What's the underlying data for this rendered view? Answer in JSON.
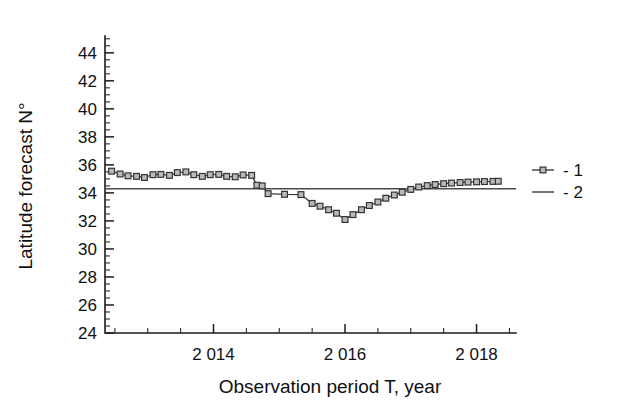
{
  "figure": {
    "background_color": "#ffffff",
    "width": 631,
    "height": 412
  },
  "chart_data": {
    "type": "line",
    "title": "",
    "subtitle": "",
    "xlabel": "Observation period T, year",
    "ylabel": "Latitude forecast  N°",
    "xlim": [
      2012.35,
      2018.6
    ],
    "ylim": [
      24,
      45.2
    ],
    "grid": false,
    "legend_position": "right",
    "x_tick_labels": [
      "2 014",
      "2 016",
      "2 018"
    ],
    "x_tick_values": [
      2014,
      2016,
      2018
    ],
    "x_minor_per_interval": 3,
    "y_tick_labels": [
      "24",
      "26",
      "28",
      "30",
      "32",
      "34",
      "36",
      "38",
      "40",
      "42",
      "44"
    ],
    "y_tick_values": [
      24,
      26,
      28,
      30,
      32,
      34,
      36,
      38,
      40,
      42,
      44
    ],
    "y_minor_per_interval": 3,
    "series": [
      {
        "name": "1",
        "legend_label": "- 1",
        "style": "line-with-square-markers",
        "marker": "open-square",
        "marker_color": "#b9b9b9",
        "marker_edge_color": "#333333",
        "line_color": "#3c3c3c",
        "x": [
          2012.45,
          2012.58,
          2012.7,
          2012.83,
          2012.95,
          2013.08,
          2013.2,
          2013.33,
          2013.45,
          2013.58,
          2013.7,
          2013.83,
          2013.95,
          2014.08,
          2014.2,
          2014.33,
          2014.45,
          2014.58,
          2014.66,
          2014.74,
          2014.83,
          2015.08,
          2015.33,
          2015.5,
          2015.62,
          2015.75,
          2015.87,
          2016.0,
          2016.12,
          2016.25,
          2016.37,
          2016.5,
          2016.62,
          2016.75,
          2016.87,
          2017.0,
          2017.12,
          2017.25,
          2017.37,
          2017.5,
          2017.62,
          2017.75,
          2017.87,
          2018.0,
          2018.12,
          2018.25,
          2018.33
        ],
        "y": [
          35.55,
          35.35,
          35.22,
          35.18,
          35.1,
          35.3,
          35.32,
          35.25,
          35.45,
          35.5,
          35.3,
          35.18,
          35.3,
          35.32,
          35.18,
          35.15,
          35.28,
          35.25,
          34.55,
          34.5,
          33.95,
          33.9,
          33.88,
          33.25,
          33.05,
          32.8,
          32.55,
          32.1,
          32.45,
          32.8,
          33.1,
          33.35,
          33.62,
          33.85,
          34.05,
          34.25,
          34.42,
          34.52,
          34.6,
          34.66,
          34.7,
          34.74,
          34.77,
          34.79,
          34.81,
          34.82,
          34.83
        ]
      },
      {
        "name": "2",
        "legend_label": "- 2",
        "style": "plain-line",
        "marker": "none",
        "line_color": "#4a4a4a",
        "constant_value": 34.3,
        "x": [
          2012.35,
          2018.6
        ],
        "y": [
          34.3,
          34.3
        ]
      }
    ]
  },
  "legend": {
    "entries": [
      {
        "label": "- 1",
        "marker": "open-square"
      },
      {
        "label": "- 2",
        "marker": "none"
      }
    ]
  }
}
